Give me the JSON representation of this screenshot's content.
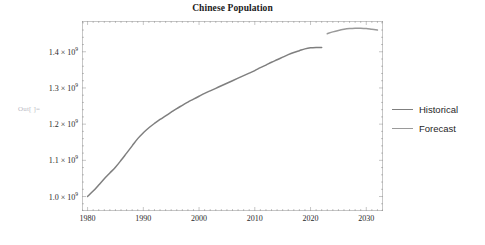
{
  "notebook": {
    "out_prompt": "Out[ ]="
  },
  "legend": {
    "items": [
      {
        "label": "Historical",
        "color": "#7f7f7f",
        "icon": "line-swatch"
      },
      {
        "label": "Forecast",
        "color": "#9a9a9a",
        "icon": "line-swatch"
      }
    ]
  },
  "axes": {
    "y_tick_labels": [
      {
        "mantissa": "1.4",
        "times": "×",
        "base": "10",
        "exp": "9",
        "value": 1400000000
      },
      {
        "mantissa": "1.3",
        "times": "×",
        "base": "10",
        "exp": "9",
        "value": 1300000000
      },
      {
        "mantissa": "1.2",
        "times": "×",
        "base": "10",
        "exp": "9",
        "value": 1200000000
      },
      {
        "mantissa": "1.1",
        "times": "×",
        "base": "10",
        "exp": "9",
        "value": 1100000000
      },
      {
        "mantissa": "1.0",
        "times": "×",
        "base": "10",
        "exp": "9",
        "value": 1000000000
      }
    ],
    "x_tick_labels": [
      "1980",
      "1990",
      "2000",
      "2010",
      "2020",
      "2030"
    ]
  },
  "chart_data": {
    "type": "line",
    "title": "Chinese Population",
    "xlabel": "",
    "ylabel": "",
    "xlim": [
      1979,
      2033
    ],
    "ylim": [
      960000000,
      1485000000
    ],
    "grid": false,
    "frame": true,
    "legend_position": "right",
    "xticks": [
      1980,
      1990,
      2000,
      2010,
      2020,
      2030
    ],
    "yticks": [
      1000000000,
      1100000000,
      1200000000,
      1300000000,
      1400000000
    ],
    "ytick_text": [
      "1.0×10⁹",
      "1.1×10⁹",
      "1.2×10⁹",
      "1.3×10⁹",
      "1.4×10⁹"
    ],
    "series": [
      {
        "name": "Historical",
        "color": "#7f7f7f",
        "x": [
          1980,
          1981,
          1982,
          1983,
          1984,
          1985,
          1986,
          1987,
          1988,
          1989,
          1990,
          1991,
          1992,
          1993,
          1994,
          1995,
          1996,
          1997,
          1998,
          1999,
          2000,
          2001,
          2002,
          2003,
          2004,
          2005,
          2006,
          2007,
          2008,
          2009,
          2010,
          2011,
          2012,
          2013,
          2014,
          2015,
          2016,
          2017,
          2018,
          2019,
          2020,
          2021,
          2022
        ],
        "values": [
          1000000000,
          1015000000,
          1032000000,
          1049000000,
          1065000000,
          1081000000,
          1100000000,
          1120000000,
          1140000000,
          1160000000,
          1176000000,
          1190000000,
          1202000000,
          1213000000,
          1223000000,
          1233000000,
          1243000000,
          1252000000,
          1261000000,
          1269000000,
          1277000000,
          1285000000,
          1292000000,
          1299000000,
          1306000000,
          1313000000,
          1320000000,
          1327000000,
          1334000000,
          1341000000,
          1348000000,
          1356000000,
          1363000000,
          1371000000,
          1378000000,
          1385000000,
          1392000000,
          1398000000,
          1403000000,
          1408000000,
          1411000000,
          1412000000,
          1412000000
        ]
      },
      {
        "name": "Forecast",
        "color": "#9a9a9a",
        "x": [
          2023,
          2024,
          2025,
          2026,
          2027,
          2028,
          2029,
          2030,
          2031,
          2032
        ],
        "values": [
          1450000000,
          1455000000,
          1459000000,
          1462000000,
          1464000000,
          1465000000,
          1465000000,
          1464000000,
          1462000000,
          1460000000
        ]
      }
    ]
  }
}
